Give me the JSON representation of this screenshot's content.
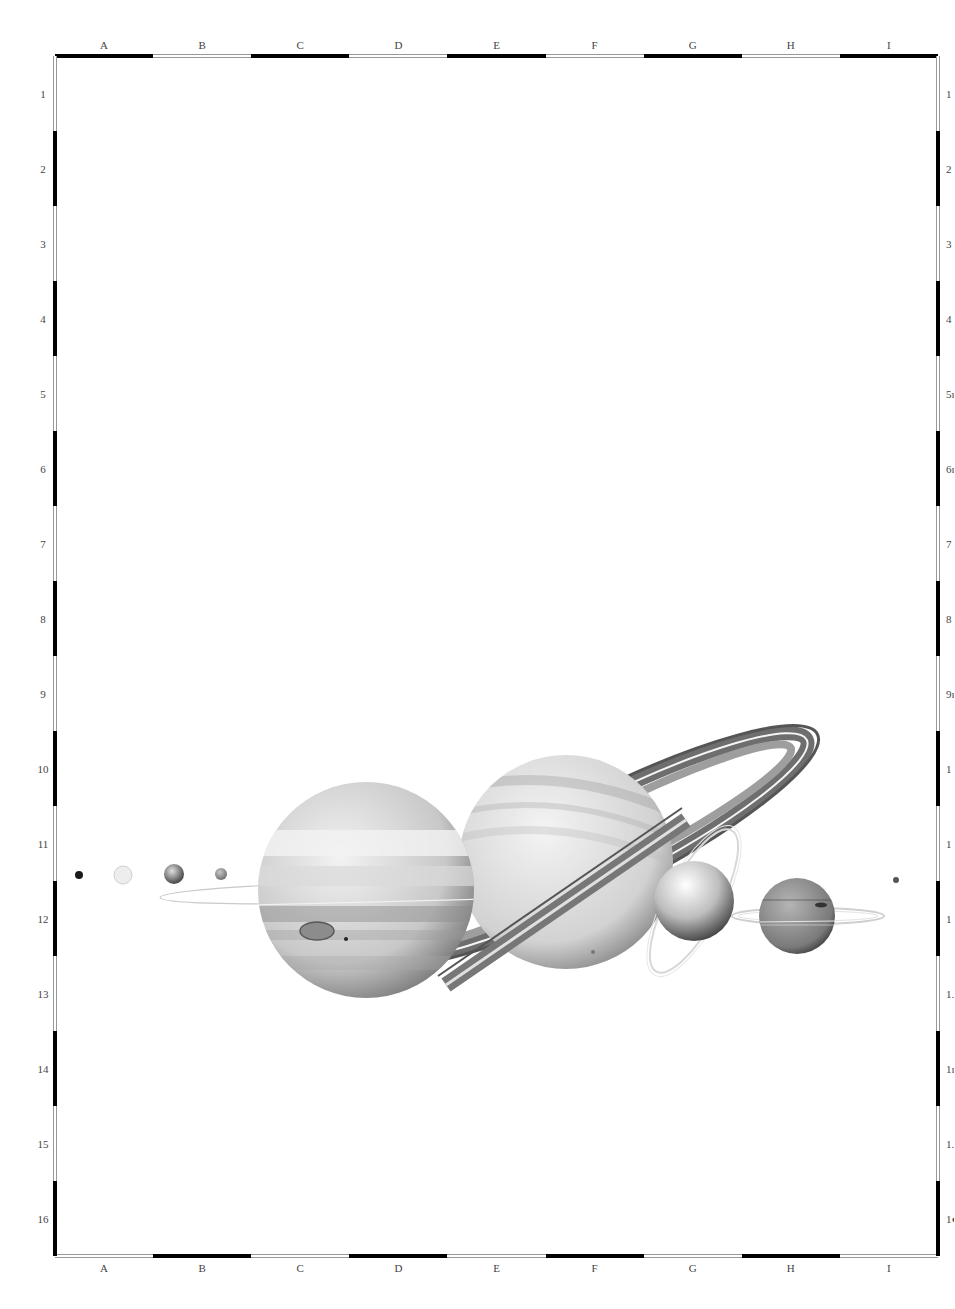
{
  "frame": {
    "left": 55,
    "top": 56,
    "right": 938,
    "bottom": 1256,
    "columns": [
      "A",
      "B",
      "C",
      "D",
      "E",
      "F",
      "G",
      "H",
      "I"
    ],
    "rows": [
      "1",
      "2",
      "3",
      "4",
      "5",
      "6",
      "7",
      "8",
      "9",
      "10",
      "11",
      "12",
      "13",
      "14",
      "15",
      "16"
    ],
    "right_labels_visible": [
      "1",
      "2",
      "3",
      "4",
      "5ı",
      "6ı",
      "7",
      "8",
      "9ı",
      "1",
      "1",
      "1",
      "1.",
      "1ı",
      "1.",
      "1●"
    ],
    "top_pattern": [
      "black",
      "white",
      "black",
      "white",
      "black",
      "white",
      "black",
      "white",
      "black"
    ],
    "bottom_pattern": [
      "white",
      "black",
      "white",
      "black",
      "white",
      "black",
      "white",
      "black",
      "white"
    ],
    "side_pattern": [
      "white",
      "black",
      "white",
      "black",
      "white",
      "black",
      "white",
      "black",
      "white",
      "black",
      "white",
      "black",
      "white",
      "black",
      "white",
      "black"
    ]
  },
  "colors": {
    "border_black": "#000000",
    "border_white_edge": "#999999",
    "background": "#ffffff"
  },
  "planets": [
    {
      "name": "mercury",
      "cx": 79,
      "cy": 875,
      "r": 4,
      "fill": "#1a1a1a"
    },
    {
      "name": "venus",
      "cx": 123,
      "cy": 875,
      "r": 9,
      "fill": "#e6e6e6"
    },
    {
      "name": "earth",
      "cx": 174,
      "cy": 874,
      "r": 10,
      "fill": "#8a8a8a"
    },
    {
      "name": "mars",
      "cx": 221,
      "cy": 874,
      "r": 6,
      "fill": "#999999"
    },
    {
      "name": "jupiter",
      "cx": 366,
      "cy": 890,
      "r": 108,
      "fill": "#cfcfcf"
    },
    {
      "name": "saturn",
      "cx": 566,
      "cy": 862,
      "r": 107,
      "fill": "#d8d8d8"
    },
    {
      "name": "uranus",
      "cx": 694,
      "cy": 901,
      "r": 40,
      "fill": "#bdbdbd"
    },
    {
      "name": "neptune",
      "cx": 797,
      "cy": 916,
      "r": 38,
      "fill": "#8f8f8f"
    },
    {
      "name": "pluto",
      "cx": 896,
      "cy": 880,
      "r": 3,
      "fill": "#555555"
    }
  ]
}
